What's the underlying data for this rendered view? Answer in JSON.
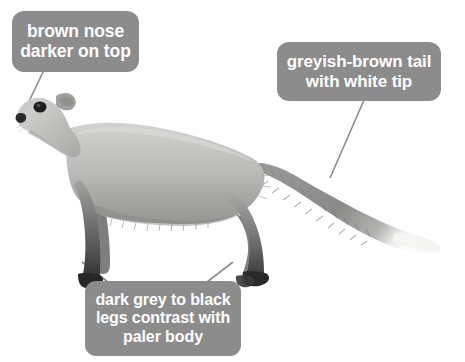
{
  "figure": {
    "background_color": "#ffffff",
    "callout_color": "#8c8c8c",
    "callout_text_color": "#ffffff",
    "leader_line_color": "#8c8c8c"
  },
  "callouts": [
    {
      "id": "nose",
      "lines": [
        "brown nose",
        "darker on top"
      ],
      "points_to": "nose"
    },
    {
      "id": "tail",
      "lines": [
        "greyish-brown tail",
        "with white tip"
      ],
      "points_to": "tail"
    },
    {
      "id": "legs",
      "lines": [
        "dark grey to black",
        "legs contrast with",
        "paler body"
      ],
      "points_to": "front leg and hind leg"
    }
  ],
  "animal": {
    "body_color": "#b8b8b6",
    "body_shadow_color": "#8e8e8c",
    "leg_dark_color": "#4a4a4a",
    "foot_color": "#2b2b2b",
    "tail_color": "#909090",
    "tail_tip_color": "#f2f2f0",
    "nose_color": "#2c2c2c",
    "eye_color": "#1e1e1e"
  }
}
